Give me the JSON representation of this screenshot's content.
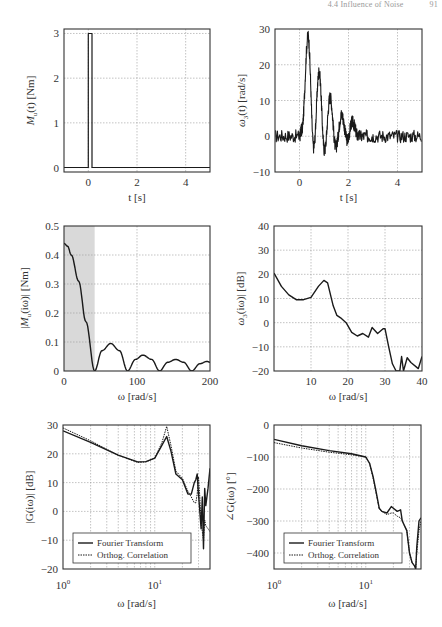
{
  "page_header": {
    "section": "4.4 Influence of Noise",
    "page": "91"
  },
  "chart_data": [
    {
      "id": "torque-time",
      "type": "line",
      "title": "",
      "xlabel": "t [s]",
      "ylabel": "M_u(t) [Nm]",
      "xlim": [
        -1,
        5
      ],
      "ylim": [
        -0.1,
        3.1
      ],
      "xticks": [
        0,
        2,
        4
      ],
      "yticks": [
        0,
        1,
        2,
        3
      ],
      "grid": true,
      "series": [
        {
          "name": "pulse",
          "x": [
            -1,
            0.0,
            0.0,
            0.15,
            0.15,
            5
          ],
          "y": [
            0,
            0,
            3,
            3,
            0,
            0
          ]
        }
      ]
    },
    {
      "id": "speed-time",
      "type": "line",
      "title": "",
      "xlabel": "t [s]",
      "ylabel": "ω_3(t) [rad/s]",
      "xlim": [
        -1,
        5
      ],
      "ylim": [
        -10,
        30
      ],
      "xticks": [
        0,
        2,
        4
      ],
      "yticks": [
        -10,
        0,
        10,
        20,
        30
      ],
      "grid": true,
      "series": [
        {
          "name": "response (noisy)",
          "x": [
            -1,
            0,
            0.1,
            0.35,
            0.58,
            0.8,
            1.02,
            1.25,
            1.48,
            1.72,
            1.95,
            2.15,
            2.4,
            3,
            4,
            5
          ],
          "y": [
            0,
            0,
            2,
            28,
            -3,
            18,
            -4,
            11,
            -3,
            6,
            -1,
            4,
            0,
            0,
            0,
            0
          ]
        }
      ]
    },
    {
      "id": "torque-spectrum",
      "type": "line",
      "title": "",
      "xlabel": "ω [rad/s]",
      "ylabel": "|M_u(iω)| [Nm]",
      "xlim": [
        0,
        200
      ],
      "ylim": [
        0,
        0.5
      ],
      "xticks": [
        0,
        100,
        200
      ],
      "yticks": [
        0,
        0.1,
        0.2,
        0.3,
        0.4,
        0.5
      ],
      "grid": true,
      "shaded_region": {
        "x": [
          0,
          42
        ],
        "color": "#d9d9d9"
      },
      "series": [
        {
          "name": "magnitude",
          "x": [
            0,
            5,
            10,
            20,
            30,
            42,
            52,
            64,
            76,
            87,
            98,
            108,
            120,
            131,
            142,
            153,
            164,
            175,
            186,
            196,
            200
          ],
          "y": [
            0.44,
            0.43,
            0.4,
            0.31,
            0.17,
            0.0,
            0.07,
            0.095,
            0.07,
            0.0,
            0.04,
            0.055,
            0.04,
            0.0,
            0.03,
            0.04,
            0.03,
            0.0,
            0.025,
            0.033,
            0.03
          ]
        }
      ]
    },
    {
      "id": "speed-spectrum",
      "type": "line",
      "title": "",
      "xlabel": "ω [rad/s]",
      "ylabel": "ω_3(iω)| [dB]",
      "xlim": [
        0,
        40
      ],
      "ylim": [
        -20,
        40
      ],
      "xticks": [
        10,
        20,
        30,
        40
      ],
      "yticks": [
        -20,
        -10,
        0,
        10,
        20,
        30,
        40
      ],
      "grid": true,
      "series": [
        {
          "name": "magnitude dB",
          "x": [
            0,
            2,
            4,
            6,
            8,
            10,
            12,
            13.5,
            14.5,
            16,
            17,
            18,
            19.5,
            21,
            22.5,
            24,
            25.5,
            26.5,
            28,
            29.5,
            30,
            31,
            32,
            33,
            34,
            34.5,
            35,
            36,
            37,
            39,
            40
          ],
          "y": [
            20.5,
            15,
            11.5,
            9.5,
            9.5,
            10.5,
            15,
            17.5,
            16.5,
            7,
            3,
            2,
            0,
            -4,
            -5.5,
            -4.5,
            -6,
            -2,
            -4.5,
            -2.5,
            -2.5,
            -10,
            -17,
            -20,
            -20,
            -14,
            -20,
            -14.5,
            -16.5,
            -19,
            -14
          ]
        }
      ]
    },
    {
      "id": "bode-magnitude",
      "type": "line",
      "title": "",
      "xlabel": "ω [rad/s]",
      "ylabel": "|G(iω)| [dB]",
      "xscale": "log",
      "xlim": [
        1,
        40
      ],
      "ylim": [
        -20,
        30
      ],
      "xticks": [
        "10^0",
        "10^1"
      ],
      "yticks": [
        -20,
        -10,
        0,
        10,
        20,
        30
      ],
      "grid": true,
      "legend": {
        "position": "lower left",
        "entries": [
          "Fourier Transform",
          "Orthog. Correlation"
        ]
      },
      "series": [
        {
          "name": "Fourier Transform",
          "style": "solid",
          "x": [
            1,
            2,
            4,
            6.5,
            8,
            10,
            12,
            13.5,
            15,
            17,
            20,
            23,
            25,
            27,
            28,
            29,
            30,
            31,
            32,
            33,
            34,
            35,
            36,
            38,
            40
          ],
          "y": [
            28,
            24,
            19.5,
            17.2,
            17.3,
            18.5,
            23,
            26,
            21,
            13,
            11,
            6,
            6,
            10,
            11,
            13,
            6,
            0,
            -6,
            5,
            -13,
            8,
            2,
            8,
            15
          ]
        },
        {
          "name": "Orthog. Correlation",
          "style": "dotted",
          "x": [
            1,
            2,
            4,
            6.5,
            8,
            10,
            12,
            13.5,
            15,
            17,
            20,
            23,
            25,
            27,
            28,
            29,
            30,
            31,
            32,
            33,
            34,
            35,
            36,
            38,
            40
          ],
          "y": [
            29,
            24.5,
            19.5,
            17,
            17.2,
            18.5,
            24,
            29.5,
            23,
            14,
            11.5,
            7,
            5,
            3,
            3,
            6,
            12,
            5,
            -4,
            -7,
            -10,
            -3,
            -5,
            -6,
            -7
          ]
        }
      ]
    },
    {
      "id": "bode-phase",
      "type": "line",
      "title": "",
      "xlabel": "ω [rad/s]",
      "ylabel": "∠G(iω) [°]",
      "xscale": "log",
      "xlim": [
        1,
        40
      ],
      "ylim": [
        -450,
        0
      ],
      "xticks": [
        "10^0",
        "10^1"
      ],
      "yticks": [
        -400,
        -300,
        -200,
        -100,
        0
      ],
      "grid": true,
      "legend": {
        "position": "lower left",
        "entries": [
          "Fourier Transform",
          "Orthog. Correlation"
        ]
      },
      "series": [
        {
          "name": "Fourier Transform",
          "style": "solid",
          "x": [
            1,
            2,
            4,
            7,
            10,
            11,
            12,
            13,
            14,
            15,
            17,
            19,
            20,
            22,
            24,
            25,
            28,
            30,
            32,
            34,
            35,
            36,
            38,
            40
          ],
          "y": [
            -45,
            -65,
            -80,
            -90,
            -100,
            -120,
            -160,
            -210,
            -260,
            -270,
            -275,
            -255,
            -260,
            -270,
            -265,
            -300,
            -330,
            -400,
            -430,
            -440,
            -450,
            -380,
            -300,
            -290
          ]
        },
        {
          "name": "Orthog. Correlation",
          "style": "dotted",
          "x": [
            1,
            2,
            4,
            7,
            10,
            11,
            12,
            13,
            14,
            15,
            17,
            19,
            20,
            22,
            24,
            25,
            28,
            30,
            32,
            34,
            35,
            36,
            38,
            40
          ],
          "y": [
            -55,
            -72,
            -85,
            -93,
            -100,
            -120,
            -165,
            -215,
            -262,
            -270,
            -280,
            -275,
            -275,
            -285,
            -290,
            -300,
            -330,
            -400,
            -430,
            -440,
            -450,
            -400,
            -330,
            -300
          ]
        }
      ]
    }
  ],
  "labels": {
    "p1": {
      "xlabel": "t [s]",
      "ylabel": "M",
      "ylabel_sub": "u",
      "ylabel_rest": "(t) [Nm]",
      "xticks": [
        "0",
        "2",
        "4"
      ],
      "yticks": [
        "0",
        "1",
        "2",
        "3"
      ]
    },
    "p2": {
      "xlabel": "t [s]",
      "ylabel": "ω",
      "ylabel_sub": "3",
      "ylabel_rest": "(t) [rad/s]",
      "xticks": [
        "0",
        "2",
        "4"
      ],
      "yticks": [
        "−10",
        "0",
        "10",
        "20",
        "30"
      ]
    },
    "p3": {
      "xlabel": "ω [rad/s]",
      "ylabel": "|M",
      "ylabel_sub": "u",
      "ylabel_rest": "(iω)| [Nm]",
      "xticks": [
        "0",
        "100",
        "200"
      ],
      "yticks": [
        "0",
        "0.1",
        "0.2",
        "0.3",
        "0.4",
        "0.5"
      ]
    },
    "p4": {
      "xlabel": "ω [rad/s]",
      "ylabel": "ω",
      "ylabel_sub": "3",
      "ylabel_rest": "(iω)| [dB]",
      "xticks": [
        "10",
        "20",
        "30",
        "40"
      ],
      "yticks": [
        "−20",
        "−10",
        "0",
        "10",
        "20",
        "30",
        "40"
      ]
    },
    "p5": {
      "xlabel": "ω [rad/s]",
      "ylabel": "|G(iω)| [dB]",
      "xticks": [
        "10",
        "10"
      ],
      "xtick_exp": [
        "0",
        "1"
      ],
      "yticks": [
        "−20",
        "−10",
        "0",
        "10",
        "20",
        "30"
      ],
      "legend": [
        "Fourier Transform",
        "Orthog. Correlation"
      ]
    },
    "p6": {
      "xlabel": "ω [rad/s]",
      "ylabel": "∠G(iω) [°]",
      "xticks": [
        "10",
        "10"
      ],
      "xtick_exp": [
        "0",
        "1"
      ],
      "yticks": [
        "−400",
        "−300",
        "−200",
        "−100",
        "0"
      ],
      "legend": [
        "Fourier Transform",
        "Orthog. Correlation"
      ]
    }
  },
  "colors": {
    "line": "#1a1a1a",
    "grid": "#9a9a9a",
    "shade": "#d9d9d9",
    "frame": "#333333"
  }
}
